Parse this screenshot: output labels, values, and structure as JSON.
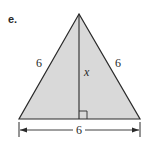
{
  "part_label": "e.",
  "triangle": {
    "left_side_label": "6",
    "right_side_label": "6",
    "base_label": "6",
    "height_label": "x",
    "fill_color": "#d9d9d9",
    "stroke_color": "#2a2a2a",
    "right_angle_marker": true
  }
}
